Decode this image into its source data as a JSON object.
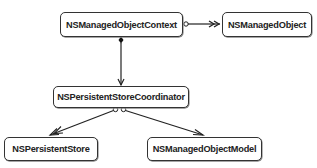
{
  "diagram": {
    "type": "class-relationship",
    "nodes": [
      {
        "id": "context",
        "label": "NSManagedObjectContext"
      },
      {
        "id": "object",
        "label": "NSManagedObject"
      },
      {
        "id": "coordinator",
        "label": "NSPersistentStoreCoordinator"
      },
      {
        "id": "store",
        "label": "NSPersistentStore"
      },
      {
        "id": "model",
        "label": "NSManagedObjectModel"
      }
    ],
    "edges": [
      {
        "from": "context",
        "to": "object",
        "source_marker": "open-circle",
        "target_marker": "double-arrow"
      },
      {
        "from": "context",
        "to": "coordinator",
        "source_marker": "filled-diamond",
        "target_marker": "arrow"
      },
      {
        "from": "coordinator",
        "to": "store",
        "source_marker": "open-circle",
        "target_marker": "double-arrow"
      },
      {
        "from": "coordinator",
        "to": "model",
        "source_marker": "open-circle",
        "target_marker": "arrow"
      }
    ],
    "colors": {
      "line": "#222222",
      "box_border": "#333333",
      "background": "#ffffff"
    }
  }
}
